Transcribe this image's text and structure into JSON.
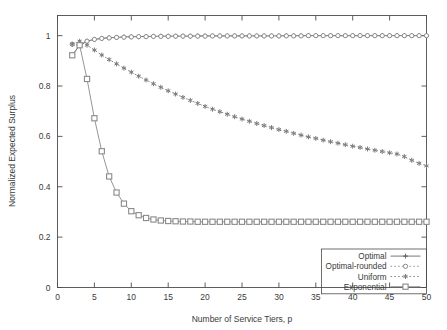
{
  "chart_data": {
    "type": "line",
    "title": "",
    "xlabel": "Number of Service Tiers, p",
    "ylabel": "Normalized Expected Surplus",
    "xlim": [
      0,
      50
    ],
    "ylim": [
      0,
      1.08
    ],
    "xticks": [
      0,
      5,
      10,
      15,
      20,
      25,
      30,
      35,
      40,
      45,
      50
    ],
    "xtick_labels": [
      "0",
      "5",
      "10",
      "15",
      "20",
      "25",
      "30",
      "35",
      "40",
      "45",
      "50"
    ],
    "yticks": [
      0,
      0.2,
      0.4,
      0.6,
      0.8,
      1
    ],
    "ytick_labels": [
      "0",
      "0.2",
      "0.4",
      "0.6",
      "0.8",
      "1"
    ],
    "grid": false,
    "legend_position": "bottom-right",
    "x": [
      2,
      3,
      4,
      5,
      6,
      7,
      8,
      9,
      10,
      11,
      12,
      13,
      14,
      15,
      16,
      17,
      18,
      19,
      20,
      21,
      22,
      23,
      24,
      25,
      26,
      27,
      28,
      29,
      30,
      31,
      32,
      33,
      34,
      35,
      36,
      37,
      38,
      39,
      40,
      41,
      42,
      43,
      44,
      45,
      46,
      47,
      48,
      49,
      50
    ],
    "series": [
      {
        "name": "Optimal",
        "marker": "plus",
        "linestyle": "solid",
        "color": "#6b6b6b",
        "values": [
          0.922,
          0.962,
          0.978,
          0.985,
          0.989,
          0.992,
          0.993,
          0.995,
          0.996,
          0.996,
          0.997,
          0.997,
          0.998,
          0.998,
          0.998,
          0.998,
          0.998,
          0.999,
          0.999,
          0.999,
          0.999,
          0.999,
          0.999,
          0.999,
          0.999,
          0.999,
          0.999,
          0.999,
          0.999,
          1.0,
          1.0,
          1.0,
          1.0,
          1.0,
          1.0,
          1.0,
          1.0,
          1.0,
          1.0,
          1.0,
          1.0,
          1.0,
          1.0,
          1.0,
          1.0,
          1.0,
          1.0,
          1.0,
          1.0
        ]
      },
      {
        "name": "Optimal-rounded",
        "marker": "open-circle",
        "linestyle": "dotted",
        "color": "#8a8a8a",
        "values": [
          0.966,
          0.962,
          0.978,
          0.985,
          0.989,
          0.991,
          0.993,
          0.994,
          0.995,
          0.996,
          0.996,
          0.997,
          0.997,
          0.997,
          0.998,
          0.998,
          0.998,
          0.998,
          0.998,
          0.999,
          0.999,
          0.999,
          0.999,
          0.999,
          0.999,
          0.999,
          0.999,
          0.999,
          0.999,
          0.999,
          0.999,
          0.999,
          1.0,
          1.0,
          1.0,
          1.0,
          1.0,
          1.0,
          1.0,
          1.0,
          1.0,
          1.0,
          1.0,
          1.0,
          1.0,
          1.0,
          1.0,
          1.0,
          1.0
        ]
      },
      {
        "name": "Uniform",
        "marker": "star",
        "linestyle": "dotted",
        "color": "#7a7a7a",
        "values": [
          0.966,
          0.978,
          0.962,
          0.943,
          0.923,
          0.905,
          0.888,
          0.871,
          0.855,
          0.839,
          0.824,
          0.809,
          0.795,
          0.781,
          0.768,
          0.755,
          0.743,
          0.731,
          0.719,
          0.708,
          0.698,
          0.688,
          0.678,
          0.669,
          0.66,
          0.651,
          0.643,
          0.635,
          0.627,
          0.62,
          0.612,
          0.605,
          0.598,
          0.592,
          0.585,
          0.579,
          0.573,
          0.567,
          0.561,
          0.556,
          0.55,
          0.545,
          0.54,
          0.535,
          0.53,
          0.52,
          0.505,
          0.493,
          0.483
        ]
      },
      {
        "name": "Exponential",
        "marker": "open-square",
        "linestyle": "solid",
        "color": "#8a8a8a",
        "values": [
          0.922,
          0.962,
          0.828,
          0.672,
          0.541,
          0.441,
          0.377,
          0.333,
          0.303,
          0.287,
          0.276,
          0.27,
          0.266,
          0.264,
          0.263,
          0.262,
          0.262,
          0.261,
          0.261,
          0.261,
          0.261,
          0.261,
          0.261,
          0.261,
          0.261,
          0.261,
          0.261,
          0.261,
          0.261,
          0.261,
          0.261,
          0.261,
          0.261,
          0.261,
          0.261,
          0.261,
          0.261,
          0.261,
          0.261,
          0.261,
          0.261,
          0.261,
          0.261,
          0.261,
          0.261,
          0.261,
          0.261,
          0.261,
          0.261
        ]
      }
    ]
  },
  "legend": {
    "entries": [
      {
        "label": "Optimal"
      },
      {
        "label": "Optimal-rounded"
      },
      {
        "label": "Uniform"
      },
      {
        "label": "Exponential"
      }
    ]
  }
}
